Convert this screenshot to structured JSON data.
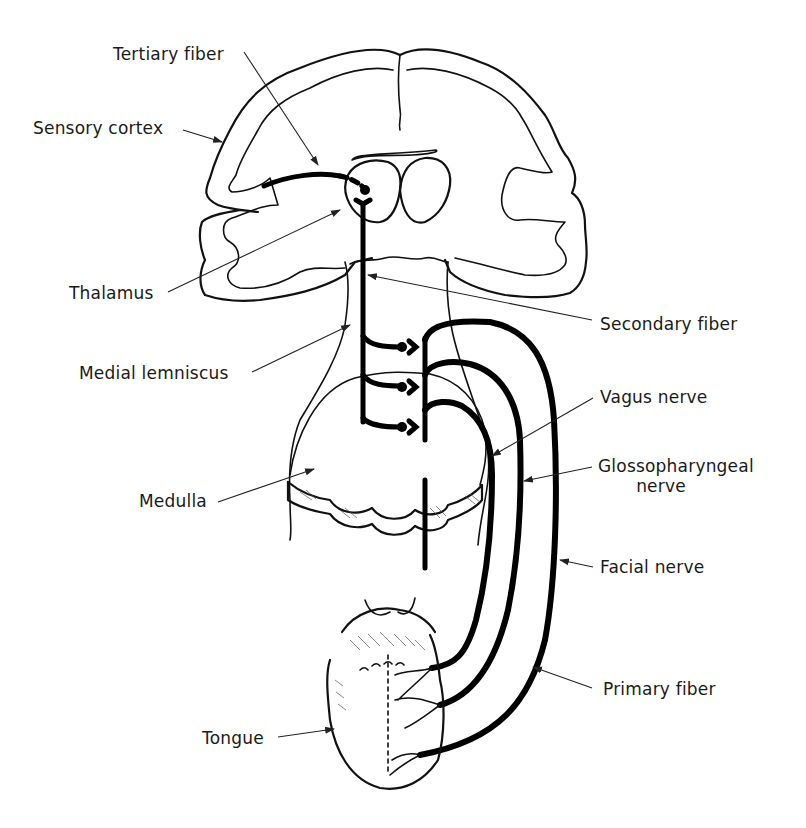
{
  "figure": {
    "colors": {
      "ink": "#111111",
      "background": "#ffffff"
    }
  },
  "labels": {
    "tertiary_fiber": "Tertiary fiber",
    "sensory_cortex": "Sensory cortex",
    "thalamus": "Thalamus",
    "secondary_fiber": "Secondary fiber",
    "medial_lemniscus": "Medial lemniscus",
    "vagus_nerve": "Vagus nerve",
    "glossopharyngeal_nerve_line1": "Glossopharyngeal",
    "glossopharyngeal_nerve_line2": "nerve",
    "medulla": "Medulla",
    "facial_nerve": "Facial nerve",
    "primary_fiber": "Primary fiber",
    "tongue": "Tongue"
  }
}
